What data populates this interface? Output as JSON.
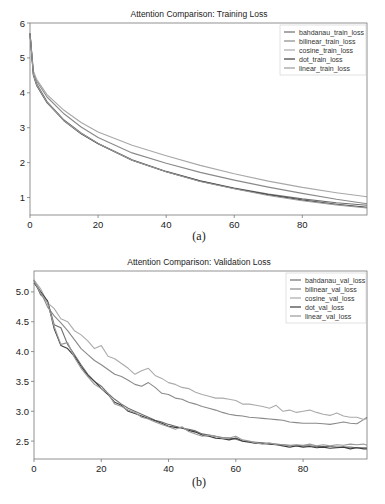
{
  "chart_data": [
    {
      "type": "line",
      "title": "Attention Comparison: Training Loss",
      "caption": "(a)",
      "xlabel": "",
      "ylabel": "",
      "xlim": [
        0,
        99
      ],
      "ylim": [
        0.5,
        6.0
      ],
      "xticks": [
        0,
        20,
        40,
        60,
        80
      ],
      "yticks": [
        1,
        2,
        3,
        4,
        5,
        6
      ],
      "grid": false,
      "legend_position": "top-right",
      "x": [
        0,
        1,
        2,
        5,
        10,
        15,
        20,
        30,
        40,
        50,
        60,
        70,
        80,
        90,
        99
      ],
      "series": [
        {
          "name": "bahdanau_train_loss",
          "color": "#6e6e6e",
          "values": [
            5.7,
            4.55,
            4.25,
            3.75,
            3.22,
            2.85,
            2.55,
            2.08,
            1.75,
            1.48,
            1.27,
            1.1,
            0.96,
            0.85,
            0.78
          ]
        },
        {
          "name": "bilinear_train_loss",
          "color": "#8a8a8a",
          "values": [
            5.7,
            4.6,
            4.33,
            3.88,
            3.4,
            3.02,
            2.72,
            2.28,
            1.98,
            1.72,
            1.5,
            1.3,
            1.12,
            0.95,
            0.82
          ]
        },
        {
          "name": "cosine_train_loss",
          "color": "#a8a8a8",
          "values": [
            5.7,
            4.62,
            4.38,
            3.95,
            3.5,
            3.15,
            2.88,
            2.5,
            2.2,
            1.92,
            1.68,
            1.47,
            1.29,
            1.14,
            1.02
          ]
        },
        {
          "name": "dot_train_loss",
          "color": "#3c3c3c",
          "values": [
            5.7,
            4.5,
            4.2,
            3.72,
            3.2,
            2.83,
            2.54,
            2.07,
            1.74,
            1.47,
            1.26,
            1.08,
            0.93,
            0.81,
            0.72
          ]
        },
        {
          "name": "linear_train_loss",
          "color": "#9a9a9a",
          "values": [
            5.7,
            4.52,
            4.22,
            3.73,
            3.2,
            2.84,
            2.55,
            2.07,
            1.74,
            1.46,
            1.25,
            1.06,
            0.91,
            0.79,
            0.7
          ]
        }
      ]
    },
    {
      "type": "line",
      "title": "Attention Comparison: Validation Loss",
      "caption": "(b)",
      "xlabel": "",
      "ylabel": "",
      "xlim": [
        0,
        99
      ],
      "ylim": [
        2.2,
        5.35
      ],
      "xticks": [
        0,
        20,
        40,
        60,
        80
      ],
      "yticks": [
        2.5,
        3.0,
        3.5,
        4.0,
        4.5,
        5.0
      ],
      "grid": false,
      "legend_position": "top-right",
      "x": [
        0,
        2,
        4,
        6,
        8,
        10,
        12,
        14,
        16,
        18,
        20,
        22,
        24,
        26,
        28,
        30,
        32,
        34,
        36,
        38,
        40,
        42,
        44,
        46,
        48,
        50,
        52,
        54,
        56,
        58,
        60,
        62,
        64,
        66,
        68,
        70,
        72,
        74,
        76,
        78,
        80,
        82,
        84,
        86,
        88,
        90,
        92,
        94,
        96,
        98,
        99
      ],
      "series": [
        {
          "name": "bahdanau_val_loss",
          "color": "#6e6e6e",
          "values": [
            5.2,
            4.95,
            4.85,
            4.45,
            4.4,
            4.12,
            3.95,
            3.78,
            3.62,
            3.5,
            3.42,
            3.3,
            3.2,
            3.12,
            3.05,
            3.0,
            2.95,
            2.9,
            2.85,
            2.82,
            2.78,
            2.75,
            2.72,
            2.7,
            2.67,
            2.62,
            2.6,
            2.58,
            2.56,
            2.55,
            2.53,
            2.5,
            2.49,
            2.48,
            2.47,
            2.46,
            2.45,
            2.44,
            2.43,
            2.43,
            2.42,
            2.42,
            2.41,
            2.41,
            2.41,
            2.4,
            2.4,
            2.4,
            2.39,
            2.39,
            2.39
          ]
        },
        {
          "name": "bilinear_val_loss",
          "color": "#8a8a8a",
          "values": [
            5.2,
            5.0,
            4.75,
            4.6,
            4.48,
            4.35,
            4.2,
            4.05,
            3.95,
            3.85,
            3.78,
            3.7,
            3.62,
            3.58,
            3.52,
            3.45,
            3.42,
            3.48,
            3.4,
            3.3,
            3.28,
            3.22,
            3.2,
            3.15,
            3.12,
            3.08,
            3.05,
            3.02,
            2.98,
            2.95,
            2.93,
            2.92,
            2.9,
            2.89,
            2.88,
            2.87,
            2.86,
            2.85,
            2.82,
            2.81,
            2.8,
            2.8,
            2.8,
            2.79,
            2.78,
            2.8,
            2.82,
            2.8,
            2.79,
            2.86,
            2.9
          ]
        },
        {
          "name": "cosine_val_loss",
          "color": "#ababab",
          "values": [
            5.2,
            5.05,
            4.82,
            4.72,
            4.55,
            4.5,
            4.35,
            4.28,
            4.18,
            4.05,
            4.1,
            3.92,
            3.88,
            3.8,
            3.72,
            3.62,
            3.68,
            3.72,
            3.6,
            3.55,
            3.48,
            3.45,
            3.4,
            3.38,
            3.32,
            3.28,
            3.25,
            3.22,
            3.22,
            3.2,
            3.18,
            3.12,
            3.12,
            3.1,
            3.08,
            3.05,
            3.1,
            3.0,
            3.02,
            2.98,
            3.0,
            3.02,
            2.98,
            2.95,
            2.93,
            2.97,
            2.92,
            2.9,
            2.9,
            2.86,
            2.88
          ]
        },
        {
          "name": "dot_val_loss",
          "color": "#3c3c3c",
          "values": [
            5.15,
            5.0,
            4.85,
            4.38,
            4.1,
            4.05,
            3.92,
            3.75,
            3.6,
            3.5,
            3.38,
            3.28,
            3.15,
            3.1,
            3.0,
            2.96,
            2.92,
            2.88,
            2.84,
            2.8,
            2.75,
            2.73,
            2.72,
            2.68,
            2.65,
            2.6,
            2.58,
            2.55,
            2.54,
            2.52,
            2.55,
            2.5,
            2.48,
            2.46,
            2.46,
            2.45,
            2.44,
            2.42,
            2.4,
            2.42,
            2.4,
            2.41,
            2.39,
            2.4,
            2.38,
            2.39,
            2.4,
            2.37,
            2.39,
            2.37,
            2.37
          ]
        },
        {
          "name": "linear_val_loss",
          "color": "#9a9a9a",
          "values": [
            5.18,
            4.98,
            4.82,
            4.42,
            4.12,
            4.15,
            3.9,
            3.72,
            3.58,
            3.45,
            3.38,
            3.3,
            3.12,
            3.08,
            3.02,
            2.98,
            2.9,
            2.87,
            2.82,
            2.78,
            2.74,
            2.7,
            2.74,
            2.66,
            2.62,
            2.58,
            2.6,
            2.58,
            2.55,
            2.55,
            2.58,
            2.52,
            2.5,
            2.47,
            2.45,
            2.47,
            2.44,
            2.44,
            2.42,
            2.44,
            2.43,
            2.45,
            2.42,
            2.44,
            2.42,
            2.44,
            2.43,
            2.45,
            2.44,
            2.45,
            2.43
          ]
        }
      ]
    }
  ]
}
